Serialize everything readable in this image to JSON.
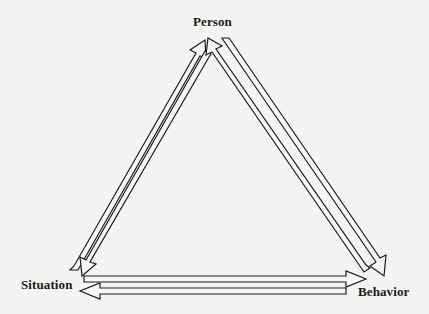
{
  "diagram": {
    "title": "",
    "type": "reciprocal-triad",
    "nodes": {
      "person": "Person",
      "situation": "Situation",
      "behavior": "Behavior"
    },
    "edges": [
      {
        "from": "situation",
        "to": "person",
        "style": "hollow-arrow"
      },
      {
        "from": "person",
        "to": "situation",
        "style": "hollow-arrow"
      },
      {
        "from": "person",
        "to": "behavior",
        "style": "hollow-arrow"
      },
      {
        "from": "behavior",
        "to": "person",
        "style": "hollow-arrow"
      },
      {
        "from": "situation",
        "to": "behavior",
        "style": "hollow-arrow"
      },
      {
        "from": "behavior",
        "to": "situation",
        "style": "hollow-arrow"
      }
    ],
    "colors": {
      "background": "#f4f4f2",
      "stroke": "#1c1c1c",
      "text": "#1a1a1a"
    }
  }
}
